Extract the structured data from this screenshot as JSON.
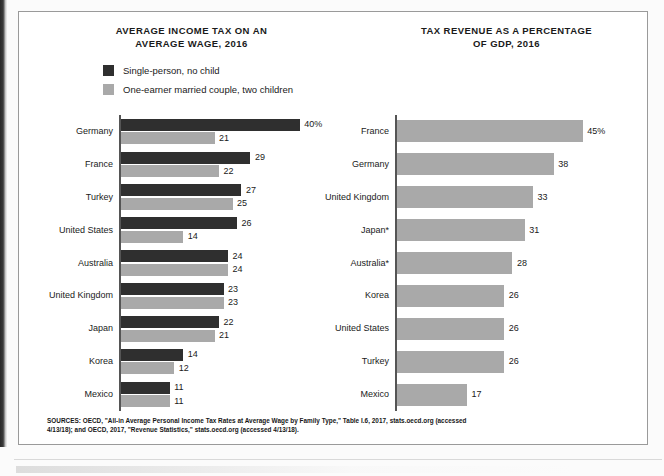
{
  "figure": {
    "sources_note": "SOURCES: OECD, \"All-in Average Personal Income Tax Rates at Average Wage by Family Type,\" Table I.6, 2017, stats.oecd.org (accessed 4/13/18); and OECD, 2017, \"Revenue Statistics,\" stats.oecd.org (accessed 4/13/18)."
  },
  "colors": {
    "series_dark": "#2f2f2f",
    "series_light": "#a9a9a9",
    "axis": "#555555",
    "frame": "#9a9a9a",
    "text": "#1a1a1a"
  },
  "left_panel": {
    "title_line1": "AVERAGE INCOME TAX ON AN",
    "title_line2": "AVERAGE WAGE, 2016",
    "legend": [
      {
        "label": "Single-person, no child",
        "color": "#2f2f2f"
      },
      {
        "label": "One-earner married couple, two children",
        "color": "#a9a9a9"
      }
    ]
  },
  "right_panel": {
    "title_line1": "TAX REVENUE AS A PERCENTAGE",
    "title_line2": "OF GDP, 2016"
  },
  "chart_data": [
    {
      "type": "bar",
      "orientation": "horizontal",
      "title": "AVERAGE INCOME TAX ON AN AVERAGE WAGE, 2016",
      "xlabel": "",
      "ylabel": "",
      "xlim": [
        0,
        40
      ],
      "grid": false,
      "legend_position": "top-left",
      "unit": "percent",
      "categories": [
        "Germany",
        "France",
        "Turkey",
        "United States",
        "Australia",
        "United Kingdom",
        "Japan",
        "Korea",
        "Mexico"
      ],
      "series": [
        {
          "name": "Single-person, no child",
          "color": "#2f2f2f",
          "values": [
            40,
            29,
            27,
            26,
            24,
            23,
            22,
            14,
            11
          ],
          "labels": [
            "40%",
            "29",
            "27",
            "26",
            "24",
            "23",
            "22",
            "14",
            "11"
          ]
        },
        {
          "name": "One-earner married couple, two children",
          "color": "#a9a9a9",
          "values": [
            21,
            22,
            25,
            14,
            24,
            23,
            21,
            12,
            11
          ],
          "labels": [
            "21",
            "22",
            "25",
            "14",
            "24",
            "23",
            "21",
            "12",
            "11"
          ]
        }
      ]
    },
    {
      "type": "bar",
      "orientation": "horizontal",
      "title": "TAX REVENUE AS A PERCENTAGE OF GDP, 2016",
      "xlabel": "",
      "ylabel": "",
      "xlim": [
        0,
        45
      ],
      "grid": false,
      "legend_position": "none",
      "unit": "percent",
      "categories": [
        "France",
        "Germany",
        "United Kingdom",
        "Japan*",
        "Australia*",
        "Korea",
        "United States",
        "Turkey",
        "Mexico"
      ],
      "series": [
        {
          "name": "Tax revenue as a percentage of GDP",
          "color": "#a9a9a9",
          "values": [
            45,
            38,
            33,
            31,
            28,
            26,
            26,
            26,
            17
          ],
          "labels": [
            "45%",
            "38",
            "33",
            "31",
            "28",
            "26",
            "26",
            "26",
            "17"
          ]
        }
      ]
    }
  ]
}
